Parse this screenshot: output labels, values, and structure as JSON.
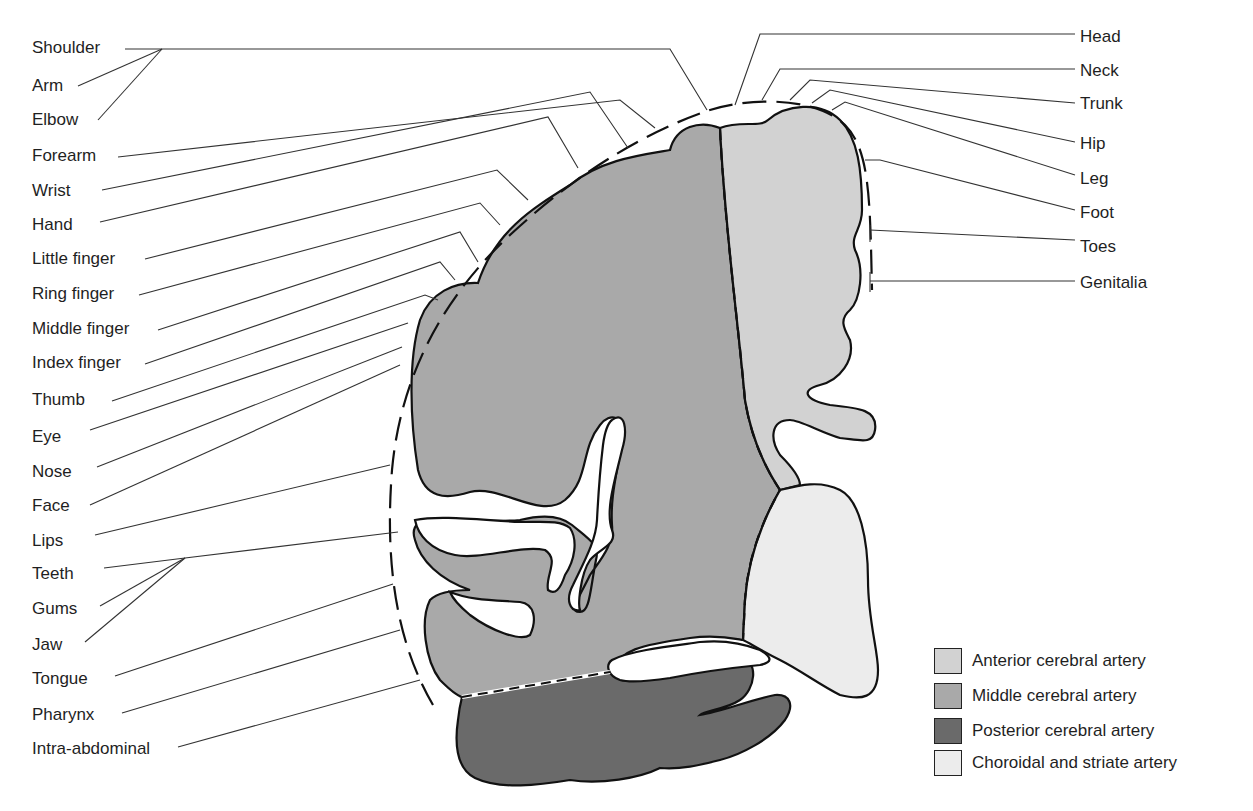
{
  "diagram": {
    "left_labels": [
      {
        "text": "Shoulder",
        "x": 32,
        "y": 38
      },
      {
        "text": "Arm",
        "x": 32,
        "y": 76
      },
      {
        "text": "Elbow",
        "x": 32,
        "y": 110
      },
      {
        "text": "Forearm",
        "x": 32,
        "y": 146
      },
      {
        "text": "Wrist",
        "x": 32,
        "y": 181
      },
      {
        "text": "Hand",
        "x": 32,
        "y": 215
      },
      {
        "text": "Little finger",
        "x": 32,
        "y": 249
      },
      {
        "text": "Ring finger",
        "x": 32,
        "y": 284
      },
      {
        "text": "Middle finger",
        "x": 32,
        "y": 319
      },
      {
        "text": "Index finger",
        "x": 32,
        "y": 353
      },
      {
        "text": "Thumb",
        "x": 32,
        "y": 390
      },
      {
        "text": "Eye",
        "x": 32,
        "y": 427
      },
      {
        "text": "Nose",
        "x": 32,
        "y": 462
      },
      {
        "text": "Face",
        "x": 32,
        "y": 496
      },
      {
        "text": "Lips",
        "x": 32,
        "y": 531
      },
      {
        "text": "Teeth",
        "x": 32,
        "y": 564
      },
      {
        "text": "Gums",
        "x": 32,
        "y": 599
      },
      {
        "text": "Jaw",
        "x": 32,
        "y": 635
      },
      {
        "text": "Tongue",
        "x": 32,
        "y": 669
      },
      {
        "text": "Pharynx",
        "x": 32,
        "y": 705
      },
      {
        "text": "Intra-abdominal",
        "x": 32,
        "y": 739
      }
    ],
    "right_labels": [
      {
        "text": "Head",
        "x": 1080,
        "y": 27
      },
      {
        "text": "Neck",
        "x": 1080,
        "y": 61
      },
      {
        "text": "Trunk",
        "x": 1080,
        "y": 94
      },
      {
        "text": "Hip",
        "x": 1080,
        "y": 134
      },
      {
        "text": "Leg",
        "x": 1080,
        "y": 169
      },
      {
        "text": "Foot",
        "x": 1080,
        "y": 203
      },
      {
        "text": "Toes",
        "x": 1080,
        "y": 237
      },
      {
        "text": "Genitalia",
        "x": 1080,
        "y": 273
      }
    ],
    "legend": [
      {
        "label": "Anterior cerebral artery",
        "color": "#d2d2d2"
      },
      {
        "label": "Middle cerebral artery",
        "color": "#a9a9a9"
      },
      {
        "label": "Posterior cerebral artery",
        "color": "#6a6a6a"
      },
      {
        "label": "Choroidal and striate artery",
        "color": "#ececec"
      }
    ]
  },
  "colors": {
    "anterior": "#d2d2d2",
    "middle": "#a9a9a9",
    "posterior": "#6a6a6a",
    "choroidal": "#ececec",
    "outline": "#111111",
    "leader": "#333333"
  }
}
